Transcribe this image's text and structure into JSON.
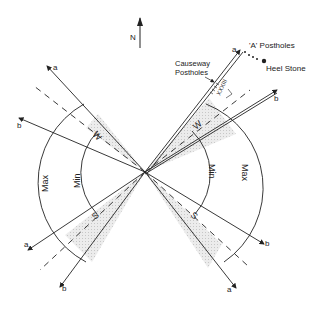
{
  "compass": {
    "label": "N"
  },
  "labels": {
    "a_postholes": "'A' Postholes",
    "heel_stone": "Heel Stone",
    "causeway_line1": "Causeway",
    "causeway_line2": "Postholes",
    "roman_marks": "XXXIII",
    "max": "Max",
    "min": "Min",
    "sector_w": "W",
    "sector_s": "S",
    "ray_a": "a",
    "ray_b": "b"
  },
  "colors": {
    "line": "#222222",
    "shade": "#e6e6e6"
  }
}
